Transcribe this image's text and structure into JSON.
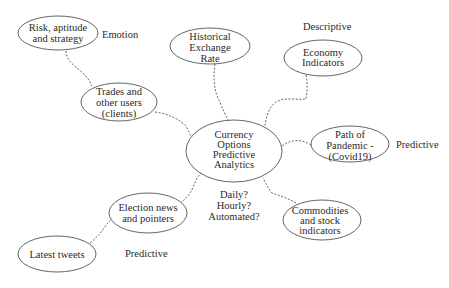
{
  "diagram": {
    "type": "mind-map",
    "center": {
      "id": "center",
      "lines": [
        "Currency",
        "Options",
        "Predictive",
        "Analytics"
      ]
    },
    "nodes": [
      {
        "id": "risk",
        "lines": [
          "Risk, aptitude",
          "and strategy"
        ]
      },
      {
        "id": "trades",
        "lines": [
          "Trades and",
          "other users",
          "(clients)"
        ]
      },
      {
        "id": "historical",
        "lines": [
          "Historical",
          "Exchange",
          "Rate"
        ]
      },
      {
        "id": "economy",
        "lines": [
          "Economy",
          "Indicators"
        ]
      },
      {
        "id": "pandemic",
        "lines": [
          "Path of",
          "Pandemic -",
          "(Covid19)"
        ]
      },
      {
        "id": "commodities",
        "lines": [
          "Commodities",
          "and stock",
          "indicators"
        ]
      },
      {
        "id": "election",
        "lines": [
          "Election news",
          "and pointers"
        ]
      },
      {
        "id": "tweets",
        "lines": [
          "Latest tweets"
        ]
      }
    ],
    "edges": [
      {
        "from": "risk",
        "to": "trades"
      },
      {
        "from": "trades",
        "to": "center"
      },
      {
        "from": "historical",
        "to": "center"
      },
      {
        "from": "economy",
        "to": "center"
      },
      {
        "from": "pandemic",
        "to": "center"
      },
      {
        "from": "commodities",
        "to": "center"
      },
      {
        "from": "election",
        "to": "center"
      },
      {
        "from": "tweets",
        "to": "election"
      }
    ],
    "annotations": {
      "emotion": "Emotion",
      "descriptive": "Descriptive",
      "predictive_pandemic": "Predictive",
      "predictive_tweets": "Predictive",
      "frequency": [
        "Daily?",
        "Hourly?",
        "Automated?"
      ]
    }
  }
}
